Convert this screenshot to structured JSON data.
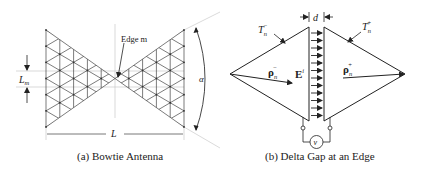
{
  "figure_a": {
    "caption": "(a)  Bowtie Antenna",
    "labels": {
      "edge": "Edge m",
      "edge_length": "L",
      "edge_length_sub": "m",
      "length": "L",
      "angle": "α"
    }
  },
  "figure_b": {
    "caption": "(b)  Delta Gap at an Edge",
    "labels": {
      "gap": "d",
      "t_minus": "T",
      "t_minus_sub": "n",
      "t_minus_sup": "−",
      "t_plus": "T",
      "t_plus_sub": "n",
      "t_plus_sup": "+",
      "rho_minus": "ρ",
      "rho_minus_sub": "n",
      "rho_minus_sup": "−",
      "rho_plus": "ρ",
      "rho_plus_sub": "n",
      "rho_plus_sup": "+",
      "field": "E",
      "field_sup": "i",
      "voltage": "v"
    }
  },
  "colors": {
    "line": "#333333",
    "guide": "#bbbbbb",
    "text": "#222222"
  }
}
